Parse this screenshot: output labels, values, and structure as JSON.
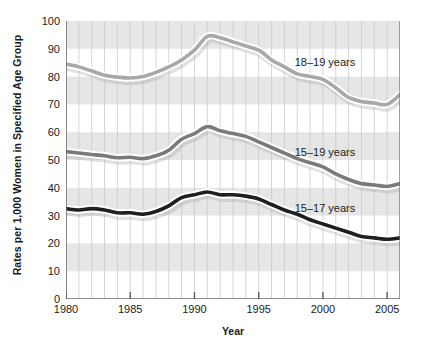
{
  "chart": {
    "title": "",
    "xlabel": "Year",
    "ylabel": "Rates per 1,000 Women in Specified Age Group"
  },
  "axis": {
    "y_ticks": [
      "0",
      "10",
      "20",
      "30",
      "40",
      "50",
      "60",
      "70",
      "80",
      "90",
      "100"
    ],
    "x_ticks": [
      "1980",
      "1985",
      "1990",
      "1995",
      "2000",
      "2005"
    ]
  },
  "annotations": {
    "series_18_19": "18–19 years",
    "series_15_19": "15–19 years",
    "series_15_17": "15–17 years"
  },
  "colors": {
    "band": "#d6d6d6",
    "gridline": "#c9c9c9",
    "axis": "#6e6e6e",
    "line_18_19": "#a8a8a8",
    "line_15_19": "#7a7a7a",
    "line_15_17": "#1f1f1f",
    "halo": "#ffffff",
    "text": "#1a1a1a"
  },
  "chart_data": {
    "type": "line",
    "title": "",
    "xlabel": "Year",
    "ylabel": "Rates per 1,000 Women in Specified Age Group",
    "xlim": [
      1980,
      2006
    ],
    "ylim": [
      0,
      100
    ],
    "grid": true,
    "legend": "inline-annotations",
    "x": [
      1980,
      1981,
      1982,
      1983,
      1984,
      1985,
      1986,
      1987,
      1988,
      1989,
      1990,
      1991,
      1992,
      1993,
      1994,
      1995,
      1996,
      1997,
      1998,
      1999,
      2000,
      2001,
      2002,
      2003,
      2004,
      2005,
      2006
    ],
    "series": [
      {
        "name": "18–19 years",
        "values": [
          84.5,
          83.5,
          82.0,
          80.5,
          79.8,
          79.5,
          80.0,
          81.5,
          83.5,
          86.0,
          89.5,
          94.5,
          94.0,
          92.5,
          91.0,
          89.5,
          86.0,
          83.5,
          81.0,
          80.0,
          79.0,
          76.0,
          72.5,
          71.0,
          70.5,
          70.0,
          73.5
        ]
      },
      {
        "name": "15–19 years",
        "values": [
          53.0,
          52.5,
          52.0,
          51.5,
          50.8,
          51.0,
          50.5,
          51.5,
          53.5,
          57.5,
          59.5,
          62.0,
          60.5,
          59.5,
          58.5,
          56.5,
          54.5,
          52.5,
          50.5,
          49.0,
          47.5,
          45.0,
          43.0,
          41.5,
          41.0,
          40.5,
          41.5
        ]
      },
      {
        "name": "15–17 years",
        "values": [
          32.5,
          32.0,
          32.5,
          32.0,
          31.0,
          31.0,
          30.5,
          31.5,
          33.5,
          36.5,
          37.5,
          38.5,
          37.5,
          37.5,
          37.0,
          36.0,
          34.0,
          32.0,
          30.5,
          28.5,
          27.0,
          25.5,
          24.0,
          22.5,
          22.0,
          21.5,
          22.0
        ]
      }
    ]
  }
}
